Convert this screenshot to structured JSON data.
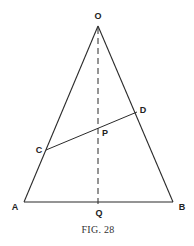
{
  "figure": {
    "caption": "Fig. 28",
    "caption_display": "FIG. 28"
  },
  "points": {
    "O": {
      "label": "O",
      "x": 98,
      "y": 26
    },
    "A": {
      "label": "A",
      "x": 24,
      "y": 202
    },
    "B": {
      "label": "B",
      "x": 173,
      "y": 202
    },
    "Q": {
      "label": "Q",
      "x": 98,
      "y": 202
    },
    "C": {
      "label": "C",
      "x": 46,
      "y": 150
    },
    "D": {
      "label": "D",
      "x": 137,
      "y": 112
    },
    "P": {
      "label": "P",
      "x": 98,
      "y": 130
    }
  },
  "segments": [
    {
      "from": "O",
      "to": "A",
      "style": "solid"
    },
    {
      "from": "O",
      "to": "B",
      "style": "solid"
    },
    {
      "from": "A",
      "to": "B",
      "style": "solid"
    },
    {
      "from": "C",
      "to": "D",
      "style": "solid"
    },
    {
      "from": "O",
      "to": "Q",
      "style": "dashed"
    }
  ],
  "colors": {
    "line": "#2a2a2a",
    "text": "#222222",
    "background": "#ffffff"
  }
}
